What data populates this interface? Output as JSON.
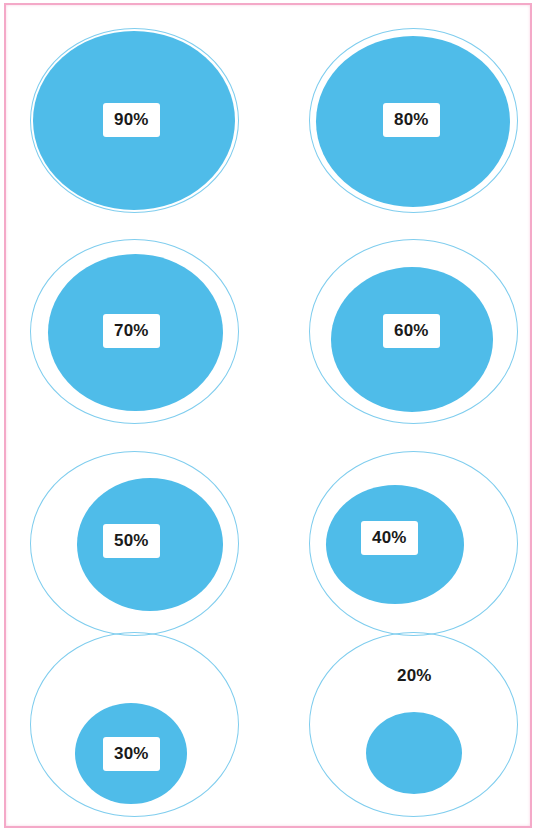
{
  "frame": {
    "border_color": "#f4a9c8",
    "background_color": "#ffffff"
  },
  "style": {
    "bubble_fill": "#4fbce9",
    "ring_stroke": "#7fcdee",
    "label_text_color": "#1a1a1a",
    "label_box_color": "#ffffff"
  },
  "chart_data": {
    "type": "bar",
    "title": "",
    "subtitle": "",
    "xlabel": "",
    "ylabel": "",
    "grid": false,
    "legend": "none",
    "unit": "%",
    "max_value": 100,
    "layout": {
      "rows": 4,
      "columns": 2,
      "order": "row-major"
    },
    "encoding": "circle-area-proportional-bubble",
    "reference_ring_value": 100,
    "categories": [
      "90%",
      "80%",
      "70%",
      "60%",
      "50%",
      "40%",
      "30%",
      "20%"
    ],
    "values": [
      90,
      80,
      70,
      60,
      50,
      40,
      30,
      20
    ],
    "labels": [
      "90%",
      "80%",
      "70%",
      "60%",
      "50%",
      "40%",
      "30%",
      "20%"
    ]
  },
  "bubbles": [
    {
      "label": "90%",
      "value": 90,
      "label_boxed": true,
      "ring": {
        "left": 30,
        "top": 28,
        "width": 209,
        "height": 185
      },
      "inner": {
        "left": 33,
        "top": 31,
        "width": 202,
        "height": 179
      },
      "label_pos": {
        "left": 103,
        "top": 103
      }
    },
    {
      "label": "80%",
      "value": 80,
      "label_boxed": true,
      "ring": {
        "left": 309,
        "top": 28,
        "width": 209,
        "height": 185
      },
      "inner": {
        "left": 316,
        "top": 36,
        "width": 194,
        "height": 171
      },
      "label_pos": {
        "left": 383,
        "top": 103
      }
    },
    {
      "label": "70%",
      "value": 70,
      "label_boxed": true,
      "ring": {
        "left": 30,
        "top": 239,
        "width": 209,
        "height": 185
      },
      "inner": {
        "left": 48,
        "top": 254,
        "width": 175,
        "height": 157
      },
      "label_pos": {
        "left": 103,
        "top": 314
      }
    },
    {
      "label": "60%",
      "value": 60,
      "label_boxed": true,
      "ring": {
        "left": 309,
        "top": 239,
        "width": 209,
        "height": 185
      },
      "inner": {
        "left": 331,
        "top": 267,
        "width": 162,
        "height": 145
      },
      "label_pos": {
        "left": 383,
        "top": 314
      }
    },
    {
      "label": "50%",
      "value": 50,
      "label_boxed": true,
      "ring": {
        "left": 30,
        "top": 451,
        "width": 209,
        "height": 185
      },
      "inner": {
        "left": 77,
        "top": 478,
        "width": 146,
        "height": 133
      },
      "label_pos": {
        "left": 103,
        "top": 524
      }
    },
    {
      "label": "40%",
      "value": 40,
      "label_boxed": true,
      "ring": {
        "left": 309,
        "top": 451,
        "width": 209,
        "height": 185
      },
      "inner": {
        "left": 326,
        "top": 485,
        "width": 138,
        "height": 119
      },
      "label_pos": {
        "left": 361,
        "top": 521
      }
    },
    {
      "label": "30%",
      "value": 30,
      "label_boxed": true,
      "ring": {
        "left": 30,
        "top": 632,
        "width": 209,
        "height": 185
      },
      "inner": {
        "left": 75,
        "top": 703,
        "width": 112,
        "height": 101
      },
      "label_pos": {
        "left": 103,
        "top": 737
      }
    },
    {
      "label": "20%",
      "value": 20,
      "label_boxed": false,
      "ring": {
        "left": 309,
        "top": 632,
        "width": 209,
        "height": 185
      },
      "inner": {
        "left": 366,
        "top": 712,
        "width": 96,
        "height": 82
      },
      "label_pos": {
        "left": 386,
        "top": 659
      }
    }
  ]
}
